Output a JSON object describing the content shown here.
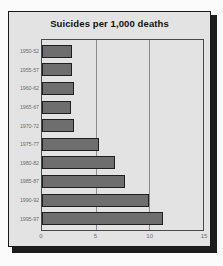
{
  "chart_data": {
    "type": "bar",
    "orientation": "horizontal",
    "title": "Suicides per 1,000 deaths",
    "xlabel": "",
    "ylabel": "",
    "xlim": [
      0,
      15
    ],
    "xticks": [
      0,
      5,
      10,
      15
    ],
    "xtick_labels": [
      "0",
      "5",
      "10",
      "15"
    ],
    "grid": true,
    "gridlines_at": [
      5,
      10
    ],
    "legend": null,
    "categories": [
      "1950-52",
      "1955-57",
      "1960-62",
      "1965-67",
      "1970-72",
      "1975-77",
      "1980-82",
      "1985-87",
      "1990-92",
      "1995-97"
    ],
    "values": [
      2.8,
      2.8,
      3.0,
      2.7,
      3.0,
      5.3,
      6.8,
      7.7,
      10.0,
      11.3
    ],
    "bar_color": "#6e6e6e",
    "bar_border_color": "#1f1f1f",
    "background_color": "#e3e3e3",
    "frame_color": "#1a1a1a",
    "tick_label_color": "#6d6d6d"
  }
}
